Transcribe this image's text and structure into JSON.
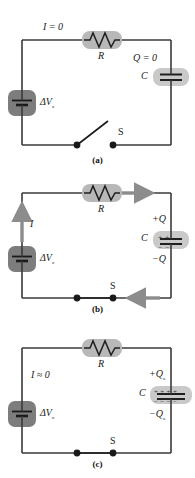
{
  "figure": {
    "type": "rc-circuit-charging-sequence",
    "panels": [
      {
        "id": "a",
        "caption": "(a)",
        "current_label": "I = 0",
        "resistor_label": "R",
        "capacitor_label": "C",
        "charge_label": "Q = 0",
        "battery_label": "ΔV",
        "battery_sub": "ₒ",
        "switch_label": "S",
        "switch_state": "open",
        "capacitor_plates": {
          "top": "",
          "bottom": ""
        },
        "arrows": []
      },
      {
        "id": "b",
        "caption": "(b)",
        "current_label": "I",
        "resistor_label": "R",
        "capacitor_label": "C",
        "charge_top": "+Q",
        "charge_bottom": "−Q",
        "battery_label": "ΔV",
        "battery_sub": "ₒ",
        "switch_label": "S",
        "switch_state": "closed",
        "capacitor_plates": {
          "top": "+ +",
          "bottom": "− −"
        },
        "arrows": [
          "top-right",
          "right-down",
          "bottom-left",
          "left-up"
        ]
      },
      {
        "id": "c",
        "caption": "(c)",
        "current_label": "I ≈ 0",
        "resistor_label": "R",
        "capacitor_label": "C",
        "charge_top": "+Q",
        "charge_top_sub": "ₒ",
        "charge_bottom": "−Q",
        "charge_bottom_sub": "ₒ",
        "battery_label": "ΔV",
        "battery_sub": "ₒ",
        "switch_label": "S",
        "switch_state": "closed",
        "capacitor_plates": {
          "top": "+ + + +",
          "bottom": "− − − −"
        },
        "arrows": []
      }
    ],
    "colors": {
      "wire": "#3a3a3a",
      "component_body": "#b8b8b8",
      "battery_body": "#7d7d7d",
      "arrow": "#8c8c8c",
      "text": "#1a1a1a"
    }
  }
}
